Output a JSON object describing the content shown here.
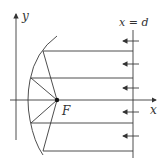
{
  "diagram": {
    "type": "parabolic-reflector",
    "labels": {
      "y_axis": "y",
      "x_axis": "x",
      "focus": "F",
      "line": "x = d"
    },
    "incoming_arrow_count": 5,
    "reflected_ray_count": 4
  }
}
